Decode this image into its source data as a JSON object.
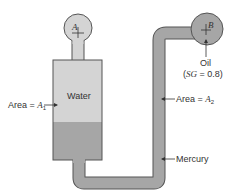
{
  "diagram": {
    "type": "manometer",
    "colors": {
      "water": "#d4d4d4",
      "mercury": "#a6a6a6",
      "oil": "#bdbdbd",
      "outline": "#555555",
      "text": "#333333"
    },
    "bulb_a": {
      "label": "A"
    },
    "bulb_b": {
      "label": "B"
    },
    "tank": {
      "fluid_upper": "Water",
      "area_label_prefix": "Area = ",
      "area_symbol": "A",
      "area_subscript": "1"
    },
    "pipe": {
      "area_label_prefix": "Area = ",
      "area_symbol": "A",
      "area_subscript": "2"
    },
    "mercury_label": "Mercury",
    "oil_label": "Oil",
    "oil_sg": {
      "open": "(",
      "symbol": "SG",
      "rest": " = 0.8)"
    }
  }
}
